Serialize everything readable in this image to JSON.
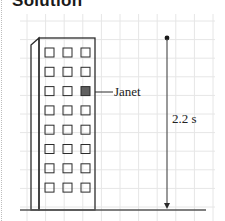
{
  "title": "Solution",
  "diagram": {
    "building": {
      "floors": 8,
      "window_columns": 3,
      "highlighted_window": {
        "floor_from_top": 3,
        "column": 3
      }
    },
    "labels": {
      "person": "Janet",
      "time": "2.2 s"
    },
    "colors": {
      "line": "#2b2b2b",
      "grid": "#e6e6e6",
      "highlight": "#606060",
      "arrow": "#555555"
    }
  }
}
